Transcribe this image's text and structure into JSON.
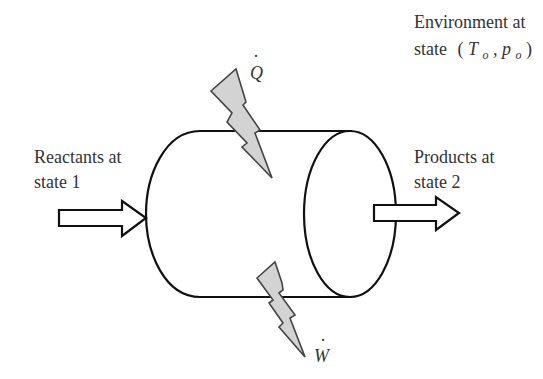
{
  "diagram": {
    "environment": {
      "line1": "Environment at",
      "line2_prefix": "state",
      "state_T": "T",
      "state_T_sub": "o",
      "state_p": "p",
      "state_p_sub": "o",
      "open_paren": "(",
      "comma": ",",
      "close_paren": ")"
    },
    "inlet": {
      "line1": "Reactants at",
      "line2": "state 1"
    },
    "outlet": {
      "line1": "Products at",
      "line2": "state 2"
    },
    "heat": {
      "symbol": "Q",
      "dot": "·"
    },
    "work": {
      "symbol": "W",
      "dot": "·"
    },
    "colors": {
      "bolt_fill": "#d3d3d3",
      "stroke": "#111111",
      "text": "#333333"
    }
  }
}
